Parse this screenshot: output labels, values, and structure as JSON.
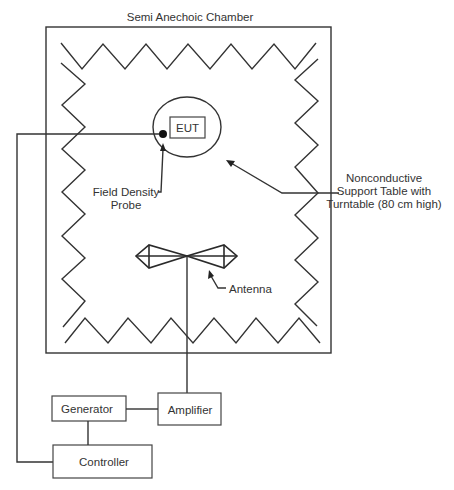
{
  "diagram": {
    "title": "Semi Anechoic Chamber",
    "components": {
      "eut": "EUT",
      "probe_label": [
        "Field Density",
        "Probe"
      ],
      "table_label": [
        "Nonconductive",
        "Support Table with",
        "Turntable (80 cm high)"
      ],
      "antenna_label": "Antenna",
      "generator": "Generator",
      "amplifier": "Amplifier",
      "controller": "Controller"
    },
    "connections": [
      {
        "from": "Field Density Probe",
        "to": "Controller"
      },
      {
        "from": "Generator",
        "to": "Amplifier"
      },
      {
        "from": "Generator",
        "to": "Controller"
      },
      {
        "from": "Amplifier",
        "to": "Antenna"
      }
    ],
    "colors": {
      "line": "#333333",
      "background": "#ffffff"
    }
  }
}
